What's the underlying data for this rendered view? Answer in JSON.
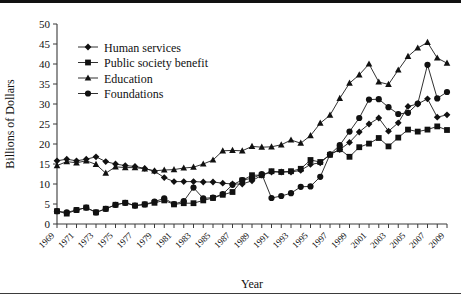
{
  "chart_data": {
    "type": "line",
    "title": "",
    "xlabel": "Year",
    "ylabel": "Billions of Dollars",
    "xlim": [
      1969,
      2009
    ],
    "ylim": [
      0,
      50
    ],
    "y_ticks": [
      0,
      5,
      10,
      15,
      20,
      25,
      30,
      35,
      40,
      45,
      50
    ],
    "x_tick_labels": [
      "1969",
      "1971",
      "1973",
      "1975",
      "1977",
      "1979",
      "1981",
      "1983",
      "1985",
      "1987",
      "1989",
      "1991",
      "1993",
      "1995",
      "1997",
      "1999",
      "2001",
      "2003",
      "2005",
      "2007",
      "2009"
    ],
    "grid": false,
    "legend_position": "upper-left-inside",
    "x": [
      1969,
      1970,
      1971,
      1972,
      1973,
      1974,
      1975,
      1976,
      1977,
      1978,
      1979,
      1980,
      1981,
      1982,
      1983,
      1984,
      1985,
      1986,
      1987,
      1988,
      1989,
      1990,
      1991,
      1992,
      1993,
      1994,
      1995,
      1996,
      1997,
      1998,
      1999,
      2000,
      2001,
      2002,
      2003,
      2004,
      2005,
      2006,
      2007,
      2008,
      2009
    ],
    "series": [
      {
        "name": "Human services",
        "marker": "diamond",
        "values": [
          15.8,
          16.2,
          15.8,
          16.2,
          16.8,
          15.6,
          15.0,
          14.6,
          14.4,
          13.9,
          13.2,
          11.6,
          10.6,
          10.6,
          10.6,
          10.5,
          10.5,
          10.2,
          10.0,
          10.0,
          10.8,
          12.2,
          13.0,
          13.0,
          13.0,
          13.4,
          14.9,
          15.3,
          17.4,
          18.6,
          20.4,
          23.0,
          25.0,
          26.5,
          23.2,
          25.3,
          29.4,
          30.0,
          31.3,
          26.7,
          27.3
        ]
      },
      {
        "name": "Public society benefit",
        "marker": "square",
        "values": [
          3.2,
          2.6,
          3.5,
          4.1,
          2.9,
          3.8,
          4.8,
          5.3,
          4.6,
          4.9,
          5.3,
          5.9,
          4.9,
          5.2,
          5.2,
          5.9,
          6.5,
          7.3,
          8.0,
          10.9,
          12.2,
          12.2,
          13.2,
          13.0,
          13.2,
          13.8,
          16.0,
          15.5,
          17.3,
          18.7,
          16.8,
          19.2,
          20.1,
          21.5,
          19.4,
          21.6,
          23.6,
          23.1,
          23.6,
          24.4,
          23.5
        ]
      },
      {
        "name": "Education",
        "marker": "triangle",
        "values": [
          14.6,
          15.6,
          15.3,
          15.8,
          14.9,
          12.7,
          14.3,
          14.1,
          14.1,
          13.8,
          13.3,
          13.5,
          13.6,
          14.0,
          14.2,
          15.0,
          16.0,
          18.3,
          18.4,
          18.3,
          19.4,
          19.2,
          19.3,
          19.8,
          21.0,
          20.2,
          22.1,
          25.2,
          27.2,
          31.4,
          35.2,
          37.3,
          40.0,
          35.5,
          34.9,
          38.5,
          41.9,
          44.0,
          45.4,
          41.5,
          40.2
        ]
      },
      {
        "name": "Foundations",
        "marker": "circle",
        "values": [
          3.2,
          2.9,
          3.5,
          4.1,
          2.9,
          3.8,
          4.8,
          5.3,
          4.6,
          4.9,
          5.6,
          6.4,
          5.0,
          5.7,
          9.1,
          6.4,
          6.6,
          7.5,
          9.8,
          11.0,
          11.4,
          12.5,
          6.5,
          7.0,
          7.7,
          9.3,
          9.4,
          11.8,
          17.4,
          19.7,
          23.1,
          26.5,
          31.1,
          31.2,
          29.2,
          27.5,
          27.8,
          30.1,
          39.8,
          31.4,
          33.0
        ]
      }
    ]
  }
}
